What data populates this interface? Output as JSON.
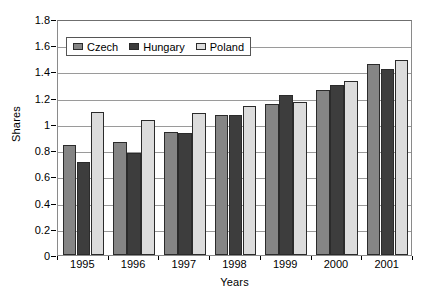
{
  "chart_data": {
    "type": "bar",
    "title": "",
    "xlabel": "Years",
    "ylabel": "Shares",
    "categories": [
      "1995",
      "1996",
      "1997",
      "1998",
      "1999",
      "2000",
      "2001"
    ],
    "series": [
      {
        "name": "Czech",
        "color": "#858585",
        "values": [
          0.84,
          0.86,
          0.94,
          1.07,
          1.15,
          1.26,
          1.46
        ]
      },
      {
        "name": "Hungary",
        "color": "#3d3d3d",
        "values": [
          0.71,
          0.78,
          0.93,
          1.07,
          1.22,
          1.3,
          1.42
        ]
      },
      {
        "name": "Poland",
        "color": "#dcdcdc",
        "values": [
          1.09,
          1.03,
          1.08,
          1.14,
          1.17,
          1.33,
          1.49
        ]
      }
    ],
    "ylim": [
      0,
      1.8
    ],
    "yticks": [
      0,
      0.2,
      0.4,
      0.6,
      0.8,
      1,
      1.2,
      1.4,
      1.6,
      1.8
    ],
    "ytick_labels": [
      "0",
      "0.2",
      "0.4",
      "0.6",
      "0.8",
      "1",
      "1.2",
      "1.4",
      "1.6",
      "1.8"
    ],
    "grid": true,
    "grid_axis": "y",
    "legend_position": "top-left-inside",
    "legend_entries": [
      "Czech",
      "Hungary",
      "Poland"
    ]
  }
}
